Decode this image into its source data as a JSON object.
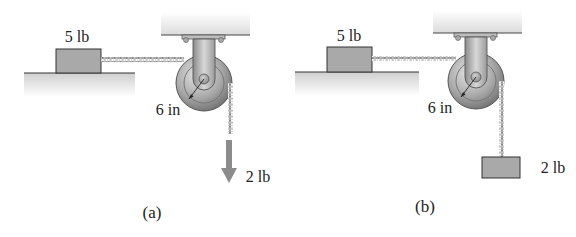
{
  "figure": {
    "panels": [
      {
        "id": "a",
        "caption": "(a)",
        "block_weight_label": "5 lb",
        "radius_label": "6 in",
        "hanging_load_label": "2 lb",
        "hanging_load_type": "force-arrow"
      },
      {
        "id": "b",
        "caption": "(b)",
        "block_weight_label": "5 lb",
        "radius_label": "6 in",
        "hanging_load_label": "2 lb",
        "hanging_load_type": "weight-block"
      }
    ],
    "colors": {
      "block_fill": "#a9a9a9",
      "ground_fill": "#d9d9d9",
      "ceiling_fill": "#e6e6e6",
      "pulley_fill": "#9a9a9a",
      "arrow_fill": "#8c8c8c",
      "text": "#222222"
    }
  }
}
